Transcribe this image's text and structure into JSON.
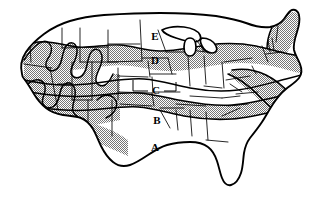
{
  "map": {
    "title": "United States Climate Zone Map",
    "description": "Contiguous United States divided into five horizontal climate zones labeled A through E, with alternating gray shaded bands. State boundaries are shown as thin lines.",
    "background_color": "#ffffff",
    "outline_color": "#000000",
    "shade_color": "#c0c0c0",
    "shade_color_dark": "#a8a8a8",
    "zones": [
      {
        "id": "zone-a",
        "label": "A",
        "shaded": false,
        "fill": "#ffffff",
        "label_x": 155,
        "label_y": 148,
        "position": "southernmost band including Texas, Gulf Coast and Florida"
      },
      {
        "id": "zone-b",
        "label": "B",
        "shaded": true,
        "fill": "#c0c0c0",
        "label_x": 157,
        "label_y": 121,
        "position": "band across Oklahoma, Arkansas and the Deep South"
      },
      {
        "id": "zone-c",
        "label": "C",
        "shaded": false,
        "fill": "#ffffff",
        "label_x": 156,
        "label_y": 91,
        "position": "central band across Kansas, Missouri and the mid-Atlantic",
        "has_leader_lines": true
      },
      {
        "id": "zone-d",
        "label": "D",
        "shaded": true,
        "fill": "#c0c0c0",
        "label_x": 155,
        "label_y": 61,
        "position": "band across Nebraska, Iowa and the Great Lakes"
      },
      {
        "id": "zone-e",
        "label": "E",
        "shaded": false,
        "fill": "#ffffff",
        "label_x": 155,
        "label_y": 37,
        "position": "northernmost band across the Dakotas and northern Minnesota"
      }
    ],
    "label_list": [
      "E",
      "D",
      "C",
      "B",
      "A"
    ],
    "features": {
      "great_lakes": "white unshaded water bodies in the upper midwest",
      "florida_peninsula": "white, zone A",
      "western_contours": "irregular wavy zone boundaries following mountain ranges",
      "northeast_maine": "gray shaded"
    }
  }
}
